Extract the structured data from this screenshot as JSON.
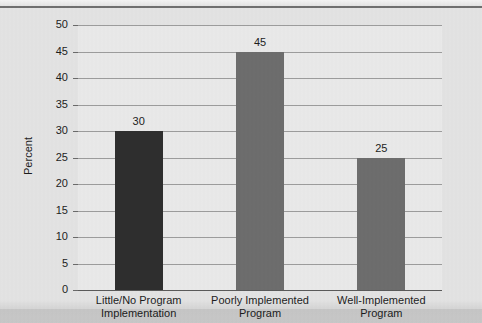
{
  "chart_data": {
    "type": "bar",
    "title": "",
    "subtitle": "",
    "xlabel": "",
    "ylabel": "Percent",
    "ylim": [
      0,
      50
    ],
    "ytick_step": 5,
    "yticks": [
      "50",
      "45",
      "40",
      "35",
      "30",
      "25",
      "20",
      "15",
      "10",
      "5",
      "0"
    ],
    "grid": true,
    "legend": "none",
    "categories": [
      "Little/No Program Implementation",
      "Poorly Implemented Program",
      "Well-Implemented Program"
    ],
    "category_lines": [
      [
        "Little/No Program",
        "Implementation"
      ],
      [
        "Poorly Implemented",
        "Program"
      ],
      [
        "Well-Implemented",
        "Program"
      ]
    ],
    "values": [
      30,
      45,
      25
    ],
    "value_labels": [
      "30",
      "45",
      "25"
    ],
    "bar_colors": [
      "#2e2e2e",
      "#6d6d6d",
      "#6d6d6d"
    ],
    "plot_background": "#e9e9e9",
    "figure_background": "#e3e3e3",
    "gridline_color": "#9c9c9c",
    "axis_color": "#6a6a6a",
    "text_color": "#1d1d1d"
  }
}
